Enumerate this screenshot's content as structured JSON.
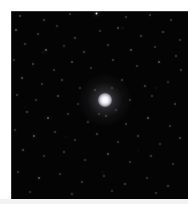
{
  "figure": {
    "kind": "astronomical-image",
    "caption": "",
    "frame": {
      "left": 11,
      "top": 11,
      "width": 177,
      "height": 188,
      "background_color": "#050505",
      "margin_color": "#ffffff"
    }
  },
  "cluster": {
    "name": "",
    "center_x": 105,
    "center_y": 100,
    "core_radius": 7,
    "halo_radius": 26,
    "core_color": "#ffffff",
    "halo_color": "#d8d8e2"
  },
  "stars": [
    {
      "x": 20,
      "y": 16,
      "r": 0.9,
      "b": 0.55
    },
    {
      "x": 44,
      "y": 20,
      "r": 0.8,
      "b": 0.45
    },
    {
      "x": 70,
      "y": 14,
      "r": 0.8,
      "b": 0.4
    },
    {
      "x": 96,
      "y": 13,
      "r": 1.5,
      "b": 0.9
    },
    {
      "x": 126,
      "y": 17,
      "r": 0.8,
      "b": 0.42
    },
    {
      "x": 150,
      "y": 15,
      "r": 0.9,
      "b": 0.5
    },
    {
      "x": 171,
      "y": 20,
      "r": 0.8,
      "b": 0.44
    },
    {
      "x": 16,
      "y": 30,
      "r": 1.3,
      "b": 0.72
    },
    {
      "x": 38,
      "y": 34,
      "r": 0.9,
      "b": 0.48
    },
    {
      "x": 57,
      "y": 26,
      "r": 0.8,
      "b": 0.4
    },
    {
      "x": 75,
      "y": 38,
      "r": 1.0,
      "b": 0.55
    },
    {
      "x": 100,
      "y": 31,
      "r": 0.8,
      "b": 0.42
    },
    {
      "x": 118,
      "y": 28,
      "r": 1.1,
      "b": 0.62
    },
    {
      "x": 141,
      "y": 36,
      "r": 0.9,
      "b": 0.5
    },
    {
      "x": 163,
      "y": 32,
      "r": 1.0,
      "b": 0.56
    },
    {
      "x": 180,
      "y": 40,
      "r": 0.8,
      "b": 0.42
    },
    {
      "x": 25,
      "y": 44,
      "r": 0.9,
      "b": 0.48
    },
    {
      "x": 46,
      "y": 50,
      "r": 1.4,
      "b": 0.82
    },
    {
      "x": 64,
      "y": 46,
      "r": 0.8,
      "b": 0.4
    },
    {
      "x": 84,
      "y": 52,
      "r": 1.0,
      "b": 0.54
    },
    {
      "x": 108,
      "y": 45,
      "r": 0.9,
      "b": 0.46
    },
    {
      "x": 131,
      "y": 50,
      "r": 1.2,
      "b": 0.68
    },
    {
      "x": 155,
      "y": 47,
      "r": 0.8,
      "b": 0.42
    },
    {
      "x": 176,
      "y": 56,
      "r": 0.9,
      "b": 0.48
    },
    {
      "x": 14,
      "y": 60,
      "r": 0.8,
      "b": 0.4
    },
    {
      "x": 33,
      "y": 64,
      "r": 1.0,
      "b": 0.56
    },
    {
      "x": 54,
      "y": 70,
      "r": 0.9,
      "b": 0.46
    },
    {
      "x": 72,
      "y": 62,
      "r": 1.1,
      "b": 0.6
    },
    {
      "x": 91,
      "y": 68,
      "r": 0.8,
      "b": 0.4
    },
    {
      "x": 113,
      "y": 60,
      "r": 1.0,
      "b": 0.52
    },
    {
      "x": 137,
      "y": 66,
      "r": 0.8,
      "b": 0.42
    },
    {
      "x": 159,
      "y": 62,
      "r": 1.3,
      "b": 0.75
    },
    {
      "x": 181,
      "y": 70,
      "r": 0.9,
      "b": 0.46
    },
    {
      "x": 22,
      "y": 78,
      "r": 1.2,
      "b": 0.66
    },
    {
      "x": 42,
      "y": 84,
      "r": 0.8,
      "b": 0.42
    },
    {
      "x": 62,
      "y": 80,
      "r": 0.9,
      "b": 0.48
    },
    {
      "x": 80,
      "y": 88,
      "r": 0.8,
      "b": 0.4
    },
    {
      "x": 122,
      "y": 80,
      "r": 0.9,
      "b": 0.48
    },
    {
      "x": 145,
      "y": 86,
      "r": 1.0,
      "b": 0.54
    },
    {
      "x": 168,
      "y": 82,
      "r": 0.8,
      "b": 0.42
    },
    {
      "x": 17,
      "y": 95,
      "r": 0.9,
      "b": 0.48
    },
    {
      "x": 36,
      "y": 100,
      "r": 0.8,
      "b": 0.4
    },
    {
      "x": 58,
      "y": 96,
      "r": 1.1,
      "b": 0.6
    },
    {
      "x": 78,
      "y": 104,
      "r": 0.8,
      "b": 0.38
    },
    {
      "x": 130,
      "y": 100,
      "r": 0.9,
      "b": 0.46
    },
    {
      "x": 152,
      "y": 96,
      "r": 0.8,
      "b": 0.42
    },
    {
      "x": 175,
      "y": 104,
      "r": 1.0,
      "b": 0.54
    },
    {
      "x": 27,
      "y": 112,
      "r": 1.0,
      "b": 0.55
    },
    {
      "x": 48,
      "y": 118,
      "r": 1.4,
      "b": 0.84
    },
    {
      "x": 68,
      "y": 114,
      "r": 0.8,
      "b": 0.4
    },
    {
      "x": 88,
      "y": 122,
      "r": 0.9,
      "b": 0.46
    },
    {
      "x": 106,
      "y": 116,
      "r": 0.8,
      "b": 0.44
    },
    {
      "x": 126,
      "y": 124,
      "r": 0.9,
      "b": 0.48
    },
    {
      "x": 148,
      "y": 118,
      "r": 1.2,
      "b": 0.7
    },
    {
      "x": 170,
      "y": 126,
      "r": 0.8,
      "b": 0.42
    },
    {
      "x": 15,
      "y": 130,
      "r": 0.8,
      "b": 0.4
    },
    {
      "x": 34,
      "y": 136,
      "r": 1.3,
      "b": 0.76
    },
    {
      "x": 55,
      "y": 132,
      "r": 0.9,
      "b": 0.48
    },
    {
      "x": 75,
      "y": 140,
      "r": 0.8,
      "b": 0.4
    },
    {
      "x": 97,
      "y": 134,
      "r": 1.0,
      "b": 0.54
    },
    {
      "x": 118,
      "y": 142,
      "r": 0.8,
      "b": 0.42
    },
    {
      "x": 138,
      "y": 136,
      "r": 0.9,
      "b": 0.5
    },
    {
      "x": 160,
      "y": 144,
      "r": 0.8,
      "b": 0.4
    },
    {
      "x": 180,
      "y": 138,
      "r": 1.0,
      "b": 0.56
    },
    {
      "x": 23,
      "y": 150,
      "r": 1.1,
      "b": 0.62
    },
    {
      "x": 44,
      "y": 156,
      "r": 0.8,
      "b": 0.4
    },
    {
      "x": 64,
      "y": 152,
      "r": 0.9,
      "b": 0.48
    },
    {
      "x": 85,
      "y": 160,
      "r": 0.8,
      "b": 0.42
    },
    {
      "x": 108,
      "y": 154,
      "r": 1.2,
      "b": 0.68
    },
    {
      "x": 130,
      "y": 162,
      "r": 0.8,
      "b": 0.4
    },
    {
      "x": 151,
      "y": 156,
      "r": 0.9,
      "b": 0.5
    },
    {
      "x": 173,
      "y": 164,
      "r": 0.8,
      "b": 0.42
    },
    {
      "x": 18,
      "y": 172,
      "r": 0.9,
      "b": 0.46
    },
    {
      "x": 39,
      "y": 178,
      "r": 1.3,
      "b": 0.78
    },
    {
      "x": 60,
      "y": 174,
      "r": 0.8,
      "b": 0.4
    },
    {
      "x": 82,
      "y": 182,
      "r": 0.9,
      "b": 0.48
    },
    {
      "x": 104,
      "y": 176,
      "r": 0.8,
      "b": 0.42
    },
    {
      "x": 125,
      "y": 184,
      "r": 1.0,
      "b": 0.55
    },
    {
      "x": 147,
      "y": 178,
      "r": 0.8,
      "b": 0.4
    },
    {
      "x": 168,
      "y": 186,
      "r": 0.9,
      "b": 0.48
    },
    {
      "x": 30,
      "y": 192,
      "r": 0.8,
      "b": 0.4
    },
    {
      "x": 72,
      "y": 194,
      "r": 0.9,
      "b": 0.46
    },
    {
      "x": 112,
      "y": 191,
      "r": 0.8,
      "b": 0.38
    },
    {
      "x": 156,
      "y": 193,
      "r": 0.9,
      "b": 0.44
    },
    {
      "x": 95,
      "y": 90,
      "r": 0.7,
      "b": 0.38
    },
    {
      "x": 116,
      "y": 110,
      "r": 0.7,
      "b": 0.36
    },
    {
      "x": 99,
      "y": 114,
      "r": 0.7,
      "b": 0.34
    },
    {
      "x": 112,
      "y": 88,
      "r": 0.7,
      "b": 0.36
    }
  ]
}
